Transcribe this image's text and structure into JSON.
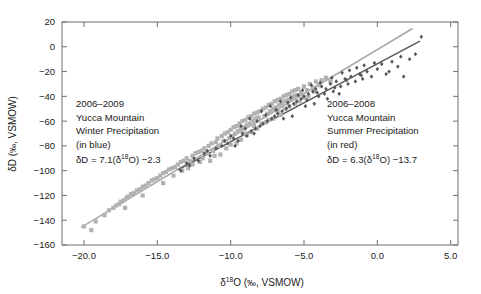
{
  "chart_data": {
    "type": "scatter",
    "title": "",
    "xlabel": "δ¹⁸O (‰, VSMOW)",
    "ylabel": "δD (‰, VSMOW)",
    "xlim": [
      -21.5,
      5.5
    ],
    "ylim": [
      -160,
      20
    ],
    "xticks": [
      -20.0,
      -15.0,
      -10.0,
      -5.0,
      0.0,
      5.0
    ],
    "xtick_labels": [
      "−20.0",
      "−15.0",
      "−10.0",
      "−5.0",
      "0.0",
      "5.0"
    ],
    "yticks": [
      20,
      0,
      -20,
      -40,
      -60,
      -80,
      -100,
      -120,
      -140,
      -160
    ],
    "ytick_labels": [
      "20",
      "0",
      "−20",
      "−40",
      "−60",
      "−80",
      "−100",
      "−120",
      "−140",
      "−160"
    ],
    "grid": false,
    "legend": "none",
    "series": [
      {
        "name": "2006–2009 Yucca Mountain Winter Precipitation",
        "color_name": "blue",
        "render_color": "#b2b2b2",
        "marker": "square",
        "marker_size": 4.2,
        "fit_label": "δD = 7.1(δ¹⁸O) −2.3",
        "fit_slope": 7.1,
        "fit_intercept": -2.3,
        "fit_color": "#a8a8a8",
        "fit_xrange": [
          -20.2,
          2.4
        ],
        "points": [
          [
            -20.0,
            -145.0
          ],
          [
            -19.2,
            -141.0
          ],
          [
            -18.6,
            -136.0
          ],
          [
            -18.3,
            -132.0
          ],
          [
            -18.0,
            -130.0
          ],
          [
            -17.8,
            -128.0
          ],
          [
            -17.6,
            -127.0
          ],
          [
            -17.5,
            -125.0
          ],
          [
            -17.3,
            -124.0
          ],
          [
            -17.1,
            -122.0
          ],
          [
            -17.0,
            -121.0
          ],
          [
            -16.8,
            -119.0
          ],
          [
            -16.6,
            -118.0
          ],
          [
            -16.4,
            -116.0
          ],
          [
            -16.2,
            -115.0
          ],
          [
            -16.0,
            -113.0
          ],
          [
            -15.8,
            -112.0
          ],
          [
            -15.6,
            -110.0
          ],
          [
            -15.4,
            -108.0
          ],
          [
            -15.2,
            -107.0
          ],
          [
            -15.0,
            -106.0
          ],
          [
            -14.8,
            -104.0
          ],
          [
            -14.6,
            -102.0
          ],
          [
            -14.4,
            -101.0
          ],
          [
            -14.2,
            -99.0
          ],
          [
            -14.0,
            -98.0
          ],
          [
            -13.8,
            -97.0
          ],
          [
            -13.6,
            -95.0
          ],
          [
            -13.4,
            -93.0
          ],
          [
            -13.2,
            -92.0
          ],
          [
            -13.0,
            -90.0
          ],
          [
            -12.8,
            -92.0
          ],
          [
            -12.6,
            -88.0
          ],
          [
            -12.4,
            -86.0
          ],
          [
            -12.2,
            -85.0
          ],
          [
            -12.0,
            -84.0
          ],
          [
            -11.8,
            -82.0
          ],
          [
            -11.6,
            -86.0
          ],
          [
            -11.5,
            -80.0
          ],
          [
            -11.3,
            -78.0
          ],
          [
            -11.2,
            -84.0
          ],
          [
            -11.0,
            -77.0
          ],
          [
            -10.9,
            -74.0
          ],
          [
            -10.8,
            -80.0
          ],
          [
            -10.6,
            -72.0
          ],
          [
            -10.5,
            -76.0
          ],
          [
            -10.4,
            -70.0
          ],
          [
            -10.2,
            -69.0
          ],
          [
            -10.1,
            -74.0
          ],
          [
            -10.0,
            -67.0
          ],
          [
            -9.9,
            -72.0
          ],
          [
            -9.8,
            -65.0
          ],
          [
            -9.7,
            -70.0
          ],
          [
            -9.6,
            -64.0
          ],
          [
            -9.5,
            -68.0
          ],
          [
            -9.4,
            -62.0
          ],
          [
            -9.3,
            -66.0
          ],
          [
            -9.2,
            -60.0
          ],
          [
            -9.1,
            -65.0
          ],
          [
            -9.0,
            -59.0
          ],
          [
            -8.9,
            -63.0
          ],
          [
            -8.8,
            -57.0
          ],
          [
            -8.7,
            -62.0
          ],
          [
            -8.6,
            -56.0
          ],
          [
            -8.5,
            -60.0
          ],
          [
            -8.4,
            -54.0
          ],
          [
            -8.3,
            -58.0
          ],
          [
            -8.2,
            -53.0
          ],
          [
            -8.1,
            -57.0
          ],
          [
            -8.0,
            -52.0
          ],
          [
            -7.9,
            -62.0
          ],
          [
            -7.8,
            -50.0
          ],
          [
            -7.7,
            -56.0
          ],
          [
            -7.6,
            -49.0
          ],
          [
            -7.5,
            -54.0
          ],
          [
            -7.4,
            -47.0
          ],
          [
            -7.3,
            -52.0
          ],
          [
            -7.2,
            -46.0
          ],
          [
            -7.1,
            -50.0
          ],
          [
            -7.0,
            -44.0
          ],
          [
            -6.9,
            -49.0
          ],
          [
            -6.8,
            -43.0
          ],
          [
            -6.7,
            -47.0
          ],
          [
            -6.6,
            -42.0
          ],
          [
            -6.5,
            -46.0
          ],
          [
            -6.4,
            -40.0
          ],
          [
            -6.3,
            -44.0
          ],
          [
            -6.2,
            -39.0
          ],
          [
            -6.1,
            -43.0
          ],
          [
            -6.0,
            -38.0
          ],
          [
            -5.9,
            -42.0
          ],
          [
            -5.8,
            -36.0
          ],
          [
            -5.7,
            -40.0
          ],
          [
            -5.6,
            -35.0
          ],
          [
            -5.5,
            -39.0
          ],
          [
            -5.4,
            -34.0
          ],
          [
            -5.2,
            -37.0
          ],
          [
            -5.0,
            -32.0
          ],
          [
            -4.8,
            -35.0
          ],
          [
            -4.6,
            -30.0
          ],
          [
            -4.4,
            -33.0
          ],
          [
            -4.2,
            -28.0
          ],
          [
            -4.0,
            -31.0
          ],
          [
            -3.8,
            -27.0
          ],
          [
            -3.5,
            -25.0
          ],
          [
            -3.2,
            -28.0
          ],
          [
            -12.6,
            -95.0
          ],
          [
            -11.9,
            -90.0
          ],
          [
            -11.1,
            -88.0
          ],
          [
            -10.3,
            -82.0
          ],
          [
            -9.6,
            -78.0
          ],
          [
            -8.9,
            -71.0
          ],
          [
            -8.2,
            -66.0
          ],
          [
            -7.6,
            -61.0
          ],
          [
            -13.9,
            -104.0
          ],
          [
            -12.9,
            -98.0
          ],
          [
            -10.7,
            -87.0
          ],
          [
            -9.3,
            -75.0
          ],
          [
            -8.6,
            -69.0
          ],
          [
            -7.1,
            -58.0
          ],
          [
            -6.6,
            -55.0
          ],
          [
            -6.0,
            -48.0
          ],
          [
            -5.3,
            -44.0
          ],
          [
            -4.7,
            -40.0
          ],
          [
            -12.1,
            -93.0
          ],
          [
            -11.4,
            -92.0
          ],
          [
            -10.0,
            -79.0
          ],
          [
            -9.0,
            -70.0
          ],
          [
            -8.4,
            -64.0
          ],
          [
            -7.4,
            -59.0
          ],
          [
            -6.8,
            -52.0
          ],
          [
            -5.6,
            -46.0
          ],
          [
            -13.3,
            -100.0
          ],
          [
            -14.6,
            -110.0
          ],
          [
            -16.0,
            -120.0
          ],
          [
            -17.2,
            -130.0
          ],
          [
            -19.5,
            -148.0
          ],
          [
            -6.3,
            -50.0
          ],
          [
            -5.0,
            -41.0
          ],
          [
            -4.3,
            -36.0
          ]
        ]
      },
      {
        "name": "2006–2008 Yucca Mountain Summer Precipitation",
        "color_name": "red",
        "render_color": "#565656",
        "marker": "diamond",
        "marker_size": 3.4,
        "fit_label": "δD = 6.3(δ¹⁸O) −13.7",
        "fit_slope": 6.3,
        "fit_intercept": -13.7,
        "fit_color": "#585858",
        "fit_xrange": [
          -13.6,
          2.9
        ],
        "points": [
          [
            -13.4,
            -100.0
          ],
          [
            -12.8,
            -96.0
          ],
          [
            -12.2,
            -92.0
          ],
          [
            -11.8,
            -86.0
          ],
          [
            -11.4,
            -88.0
          ],
          [
            -11.0,
            -82.0
          ],
          [
            -10.6,
            -80.0
          ],
          [
            -10.2,
            -78.0
          ],
          [
            -9.8,
            -74.0
          ],
          [
            -9.5,
            -76.0
          ],
          [
            -9.2,
            -70.0
          ],
          [
            -8.9,
            -72.0
          ],
          [
            -8.6,
            -68.0
          ],
          [
            -8.3,
            -66.0
          ],
          [
            -8.0,
            -64.0
          ],
          [
            -7.8,
            -62.0
          ],
          [
            -7.5,
            -60.0
          ],
          [
            -7.2,
            -58.0
          ],
          [
            -7.0,
            -56.0
          ],
          [
            -6.8,
            -54.0
          ],
          [
            -6.5,
            -52.0
          ],
          [
            -6.2,
            -50.0
          ],
          [
            -6.0,
            -48.0
          ],
          [
            -5.7,
            -46.0
          ],
          [
            -5.5,
            -44.0
          ],
          [
            -5.2,
            -42.0
          ],
          [
            -5.0,
            -40.0
          ],
          [
            -4.7,
            -38.0
          ],
          [
            -4.4,
            -36.0
          ],
          [
            -4.2,
            -34.0
          ],
          [
            -4.0,
            -40.0
          ],
          [
            -3.8,
            -32.0
          ],
          [
            -3.5,
            -34.0
          ],
          [
            -3.2,
            -30.0
          ],
          [
            -3.0,
            -36.0
          ],
          [
            -2.8,
            -28.0
          ],
          [
            -2.5,
            -32.0
          ],
          [
            -2.2,
            -26.0
          ],
          [
            -2.0,
            -30.0
          ],
          [
            -1.8,
            -24.0
          ],
          [
            -1.5,
            -28.0
          ],
          [
            -1.2,
            -22.0
          ],
          [
            -1.0,
            -26.0
          ],
          [
            -0.7,
            -20.0
          ],
          [
            -0.4,
            -24.0
          ],
          [
            0.0,
            -18.0
          ],
          [
            0.3,
            -14.0
          ],
          [
            0.6,
            -22.0
          ],
          [
            1.0,
            -12.0
          ],
          [
            1.4,
            -16.0
          ],
          [
            1.8,
            -24.0
          ],
          [
            2.2,
            -10.0
          ],
          [
            2.6,
            -6.0
          ],
          [
            3.0,
            8.0
          ],
          [
            -9.0,
            -66.0
          ],
          [
            -8.2,
            -60.0
          ],
          [
            -7.6,
            -55.0
          ],
          [
            -6.9,
            -51.0
          ],
          [
            -6.1,
            -45.0
          ],
          [
            -5.4,
            -39.0
          ],
          [
            -4.8,
            -43.0
          ],
          [
            -4.1,
            -37.0
          ],
          [
            -3.4,
            -42.0
          ],
          [
            -2.6,
            -38.0
          ],
          [
            -10.0,
            -72.0
          ],
          [
            -9.3,
            -64.0
          ],
          [
            -8.7,
            -58.0
          ],
          [
            -7.9,
            -52.0
          ],
          [
            -7.3,
            -48.0
          ],
          [
            -6.6,
            -44.0
          ],
          [
            -5.9,
            -41.0
          ],
          [
            -5.1,
            -35.0
          ],
          [
            -4.5,
            -31.0
          ],
          [
            -3.9,
            -29.0
          ],
          [
            -3.1,
            -25.0
          ],
          [
            -2.4,
            -21.0
          ],
          [
            -1.9,
            -19.0
          ],
          [
            -1.4,
            -17.0
          ],
          [
            -0.9,
            -15.0
          ],
          [
            -0.2,
            -13.0
          ],
          [
            -11.6,
            -84.0
          ],
          [
            -12.5,
            -90.0
          ],
          [
            -13.0,
            -94.0
          ],
          [
            -10.4,
            -76.0
          ],
          [
            -6.4,
            -58.0
          ],
          [
            -5.8,
            -56.0
          ],
          [
            -4.9,
            -48.0
          ],
          [
            -4.3,
            -46.0
          ],
          [
            -3.6,
            -38.0
          ],
          [
            -2.9,
            -33.0
          ],
          [
            -2.1,
            -27.0
          ],
          [
            -1.1,
            -23.0
          ],
          [
            0.8,
            -20.0
          ],
          [
            1.6,
            -8.0
          ],
          [
            -9.7,
            -80.0
          ],
          [
            -8.4,
            -70.0
          ]
        ]
      }
    ],
    "annotations": [
      {
        "id": "winter-annotation",
        "lines": [
          "2006–2009",
          "Yucca Mountain",
          "Winter Precipitation",
          "(in blue)"
        ],
        "equation_prefix": "δD = 7.1(δ",
        "equation_sup": "18",
        "equation_suffix": "O) −2.3",
        "x": 76,
        "y": 107
      },
      {
        "id": "summer-annotation",
        "lines": [
          "2006–2008",
          "Yucca Mountain",
          "Summer Precipitation",
          "(in red)"
        ],
        "equation_prefix": "δD = 6.3(δ",
        "equation_sup": "18",
        "equation_suffix": "O) −13.7",
        "x": 327,
        "y": 107
      }
    ]
  },
  "axis": {
    "y_title_prefix": "δD (",
    "y_title_permil": "‰",
    "y_title_suffix": ", VSMOW)",
    "x_title_prefix": "δ",
    "x_title_sup": "18",
    "x_title_mid": "O (",
    "x_title_permil": "‰",
    "x_title_suffix": ", VSMOW)"
  }
}
